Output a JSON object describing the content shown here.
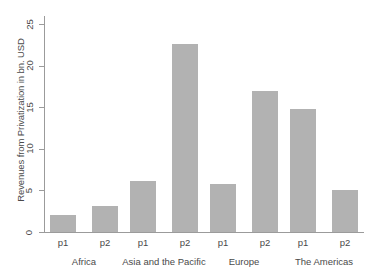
{
  "chart_data": {
    "type": "bar",
    "title": "",
    "xlabel": "",
    "ylabel": "Revenues from Privatization in bn. USD",
    "ylim": [
      0,
      26
    ],
    "yticks": [
      0,
      5,
      10,
      15,
      20,
      25
    ],
    "grid": false,
    "legend": null,
    "bar_color": "#b2b2b2",
    "axis_color": "#9b9b9b",
    "categories": [
      "p1",
      "p2",
      "p1",
      "p2",
      "p1",
      "p2",
      "p1",
      "p2"
    ],
    "groups": [
      {
        "label": "Africa",
        "bars": [
          {
            "category": "p1",
            "value": 2.0
          },
          {
            "category": "p2",
            "value": 3.1
          }
        ]
      },
      {
        "label": "Asia and the Pacific",
        "bars": [
          {
            "category": "p1",
            "value": 6.1
          },
          {
            "category": "p2",
            "value": 22.6
          }
        ]
      },
      {
        "label": "Europe",
        "bars": [
          {
            "category": "p1",
            "value": 5.8
          },
          {
            "category": "p2",
            "value": 17.0
          }
        ]
      },
      {
        "label": "The Americas",
        "bars": [
          {
            "category": "p1",
            "value": 14.8
          },
          {
            "category": "p2",
            "value": 5.0
          }
        ]
      }
    ],
    "values": [
      2.0,
      3.1,
      6.1,
      22.6,
      5.8,
      17.0,
      14.8,
      5.0
    ]
  }
}
